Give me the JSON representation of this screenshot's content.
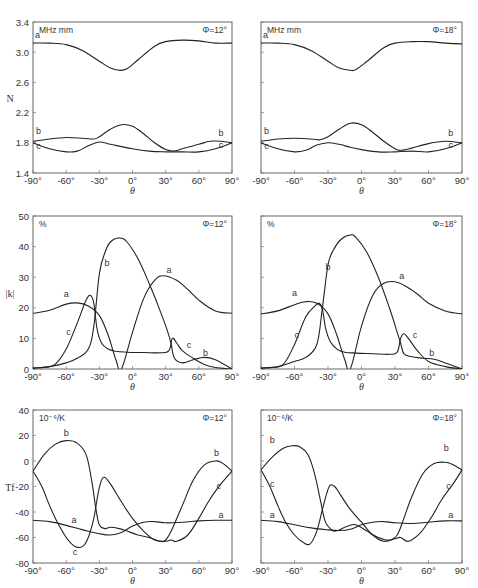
{
  "figure": {
    "x_axis": {
      "label": "θ",
      "ticks": [
        -90,
        -60,
        -30,
        0,
        30,
        60,
        90
      ],
      "tick_labels": [
        "-90°",
        "-60°",
        "-30°",
        "0°",
        "30°",
        "60°",
        "90°"
      ]
    }
  },
  "chart_data": [
    {
      "type": "line",
      "panel": "top-left",
      "title": "Φ=12°",
      "unit_label": "MHz  mm",
      "xlabel": "θ",
      "ylabel": "N",
      "xlim": [
        -90,
        90
      ],
      "ylim": [
        1.4,
        3.4
      ],
      "yticks": [
        1.4,
        1.8,
        2.2,
        2.6,
        3.0,
        3.4
      ],
      "ytick_labels": [
        "1.4",
        "1.8",
        "2.2",
        "2.6",
        "3.0",
        "3.4"
      ],
      "show_yticklabels": true,
      "grid": false,
      "series": [
        {
          "name": "a",
          "x": [
            -90,
            -75,
            -60,
            -45,
            -30,
            -20,
            -12,
            -5,
            5,
            20,
            30,
            45,
            60,
            75,
            90
          ],
          "y": [
            3.12,
            3.12,
            3.1,
            3.02,
            2.88,
            2.79,
            2.76,
            2.78,
            2.9,
            3.08,
            3.14,
            3.16,
            3.15,
            3.12,
            3.12
          ]
        },
        {
          "name": "b",
          "x": [
            -90,
            -75,
            -60,
            -45,
            -35,
            -30,
            -20,
            -10,
            0,
            10,
            20,
            30,
            37,
            45,
            60,
            70,
            80,
            90
          ],
          "y": [
            1.82,
            1.85,
            1.87,
            1.86,
            1.85,
            1.88,
            1.98,
            2.04,
            2.02,
            1.92,
            1.8,
            1.71,
            1.69,
            1.72,
            1.78,
            1.82,
            1.82,
            1.8
          ]
        },
        {
          "name": "c",
          "x": [
            -90,
            -75,
            -60,
            -50,
            -40,
            -30,
            -20,
            -10,
            0,
            15,
            30,
            45,
            60,
            75,
            90
          ],
          "y": [
            1.8,
            1.72,
            1.68,
            1.69,
            1.76,
            1.81,
            1.78,
            1.75,
            1.72,
            1.69,
            1.68,
            1.68,
            1.68,
            1.72,
            1.8
          ]
        }
      ]
    },
    {
      "type": "line",
      "panel": "top-right",
      "title": "Φ=18°",
      "unit_label": "MHz  mm",
      "xlabel": "θ",
      "ylabel": "",
      "xlim": [
        -90,
        90
      ],
      "ylim": [
        1.4,
        3.4
      ],
      "yticks": [
        1.4,
        1.8,
        2.2,
        2.6,
        3.0,
        3.4
      ],
      "show_yticklabels": false,
      "grid": false,
      "series": [
        {
          "name": "a",
          "x": [
            -90,
            -75,
            -60,
            -45,
            -30,
            -20,
            -10,
            -5,
            5,
            20,
            30,
            45,
            60,
            75,
            90
          ],
          "y": [
            3.12,
            3.12,
            3.1,
            3.02,
            2.88,
            2.79,
            2.76,
            2.77,
            2.88,
            3.06,
            3.12,
            3.14,
            3.14,
            3.12,
            3.11
          ]
        },
        {
          "name": "b",
          "x": [
            -90,
            -75,
            -60,
            -45,
            -37,
            -30,
            -20,
            -10,
            0,
            10,
            20,
            30,
            35,
            45,
            60,
            75,
            90
          ],
          "y": [
            1.82,
            1.85,
            1.86,
            1.85,
            1.84,
            1.88,
            1.98,
            2.06,
            2.04,
            1.94,
            1.82,
            1.72,
            1.7,
            1.73,
            1.79,
            1.82,
            1.8
          ]
        },
        {
          "name": "c",
          "x": [
            -90,
            -75,
            -60,
            -50,
            -40,
            -30,
            -20,
            -10,
            0,
            15,
            30,
            45,
            60,
            75,
            90
          ],
          "y": [
            1.8,
            1.72,
            1.68,
            1.7,
            1.77,
            1.8,
            1.78,
            1.74,
            1.71,
            1.68,
            1.68,
            1.69,
            1.68,
            1.72,
            1.8
          ]
        }
      ]
    },
    {
      "type": "line",
      "panel": "middle-left",
      "title": "Φ=12°",
      "unit_label": "%",
      "xlabel": "θ",
      "ylabel": "|k|",
      "xlim": [
        -90,
        90
      ],
      "ylim": [
        0,
        50
      ],
      "yticks": [
        0,
        10,
        20,
        30,
        40,
        50
      ],
      "ytick_labels": [
        "0",
        "10",
        "20",
        "30",
        "40",
        "50"
      ],
      "show_yticklabels": true,
      "grid": false,
      "series": [
        {
          "name": "a",
          "x": [
            -90,
            -75,
            -60,
            -50,
            -40,
            -30,
            -22,
            -15,
            -10,
            0,
            10,
            20,
            28,
            40,
            50,
            60,
            75,
            90
          ],
          "y": [
            18.2,
            19.2,
            21.2,
            21.6,
            20.6,
            17.5,
            11.0,
            3.0,
            0,
            12.0,
            23.0,
            29.0,
            30.5,
            29.0,
            26.0,
            22.5,
            19.0,
            18.2
          ]
        },
        {
          "name": "b",
          "x": [
            -90,
            -75,
            -60,
            -50,
            -40,
            -35,
            -30,
            -25,
            -20,
            -12,
            -5,
            5,
            15,
            25,
            32,
            35,
            38,
            45,
            55,
            65,
            75,
            90
          ],
          "y": [
            0.3,
            0.8,
            2.0,
            3.5,
            6.5,
            14.0,
            31.0,
            38.0,
            41.5,
            42.8,
            41.5,
            36.0,
            28.0,
            19.0,
            12.0,
            8.0,
            3.5,
            2.0,
            3.0,
            3.8,
            3.0,
            0
          ]
        },
        {
          "name": "c",
          "x": [
            -90,
            -80,
            -70,
            -60,
            -50,
            -42,
            -38,
            -35,
            -32,
            -28,
            -22,
            -15,
            -5,
            10,
            25,
            33,
            36,
            40,
            45,
            55,
            65,
            75,
            90
          ],
          "y": [
            0.3,
            0.5,
            1.5,
            6.5,
            15.0,
            22.5,
            24.0,
            21.5,
            13.0,
            8.5,
            6.5,
            5.8,
            5.5,
            5.4,
            5.3,
            6.0,
            10.0,
            8.5,
            6.0,
            3.5,
            1.5,
            0.5,
            0
          ]
        }
      ]
    },
    {
      "type": "line",
      "panel": "middle-right",
      "title": "Φ=18°",
      "unit_label": "%",
      "xlabel": "θ",
      "ylabel": "",
      "xlim": [
        -90,
        90
      ],
      "ylim": [
        0,
        50
      ],
      "yticks": [
        0,
        10,
        20,
        30,
        40,
        50
      ],
      "show_yticklabels": false,
      "grid": false,
      "series": [
        {
          "name": "a",
          "x": [
            -90,
            -75,
            -60,
            -50,
            -40,
            -30,
            -22,
            -15,
            -10,
            0,
            10,
            20,
            30,
            40,
            50,
            60,
            75,
            90
          ],
          "y": [
            18.0,
            19.0,
            21.0,
            22.0,
            21.5,
            18.0,
            11.0,
            3.0,
            0,
            14.0,
            24.0,
            28.0,
            28.5,
            27.0,
            24.5,
            21.5,
            19.0,
            18.0
          ]
        },
        {
          "name": "b",
          "x": [
            -90,
            -75,
            -60,
            -50,
            -40,
            -35,
            -30,
            -25,
            -18,
            -10,
            -5,
            5,
            15,
            25,
            32,
            35,
            38,
            45,
            55,
            65,
            75,
            90
          ],
          "y": [
            0.3,
            0.8,
            2.5,
            3.8,
            8.0,
            20.0,
            34.0,
            39.0,
            42.5,
            43.8,
            43.0,
            38.0,
            30.0,
            20.0,
            12.0,
            8.5,
            5.0,
            4.0,
            3.5,
            3.2,
            2.0,
            0
          ]
        },
        {
          "name": "c",
          "x": [
            -90,
            -80,
            -70,
            -60,
            -50,
            -42,
            -38,
            -35,
            -32,
            -28,
            -22,
            -15,
            -5,
            10,
            25,
            32,
            35,
            38,
            42,
            50,
            60,
            75,
            90
          ],
          "y": [
            0.3,
            0.5,
            1.5,
            8.0,
            17.0,
            20.5,
            21.5,
            19.5,
            13.0,
            9.0,
            6.5,
            5.5,
            5.2,
            5.0,
            4.8,
            5.5,
            10.0,
            11.5,
            10.0,
            6.0,
            2.5,
            0.8,
            0
          ]
        }
      ]
    },
    {
      "type": "line",
      "panel": "bottom-left",
      "title": "Φ=12°",
      "unit_label": "10⁻⁶/K",
      "xlabel": "θ",
      "ylabel": "Tf",
      "xlim": [
        -90,
        90
      ],
      "ylim": [
        -80,
        40
      ],
      "yticks": [
        -80,
        -60,
        -40,
        -20,
        0,
        20,
        40
      ],
      "ytick_labels": [
        "-80",
        "-60",
        "-40",
        "-20",
        "0",
        "20",
        "40"
      ],
      "show_yticklabels": true,
      "grid": false,
      "series": [
        {
          "name": "a",
          "x": [
            -90,
            -75,
            -60,
            -45,
            -30,
            -20,
            -10,
            0,
            10,
            20,
            30,
            45,
            60,
            75,
            90
          ],
          "y": [
            -46.5,
            -47.5,
            -50.5,
            -54.0,
            -57.0,
            -58.0,
            -56.0,
            -51.0,
            -48.0,
            -47.5,
            -48.5,
            -48.0,
            -47.0,
            -46.5,
            -46.5
          ]
        },
        {
          "name": "b",
          "x": [
            -90,
            -80,
            -70,
            -60,
            -50,
            -42,
            -37,
            -33,
            -30,
            -25,
            -20,
            -12,
            -5,
            5,
            15,
            25,
            30,
            35,
            45,
            55,
            65,
            75,
            80,
            85,
            90
          ],
          "y": [
            -8,
            5,
            13,
            16,
            14,
            5,
            -15,
            -38,
            -50,
            -53,
            -52,
            -53,
            -55,
            -58,
            -60,
            -63,
            -62,
            -55,
            -35,
            -15,
            -3,
            0,
            -1,
            -4,
            -8
          ]
        },
        {
          "name": "c",
          "x": [
            -90,
            -82,
            -75,
            -68,
            -60,
            -52,
            -45,
            -40,
            -35,
            -31,
            -28,
            -25,
            -20,
            -10,
            0,
            10,
            20,
            30,
            35,
            40,
            50,
            60,
            70,
            80,
            90
          ],
          "y": [
            -8,
            -20,
            -35,
            -48,
            -60,
            -67,
            -67,
            -60,
            -45,
            -25,
            -15,
            -13,
            -18,
            -32,
            -45,
            -55,
            -62,
            -63,
            -62,
            -63,
            -58,
            -45,
            -30,
            -18,
            -8
          ]
        }
      ]
    },
    {
      "type": "line",
      "panel": "bottom-right",
      "title": "Φ=18°",
      "unit_label": "10⁻⁶/K",
      "xlabel": "θ",
      "ylabel": "",
      "xlim": [
        -90,
        90
      ],
      "ylim": [
        -80,
        40
      ],
      "yticks": [
        -80,
        -60,
        -40,
        -20,
        0,
        20,
        40
      ],
      "show_yticklabels": false,
      "grid": false,
      "series": [
        {
          "name": "a",
          "x": [
            -90,
            -75,
            -60,
            -45,
            -30,
            -20,
            -10,
            0,
            10,
            20,
            30,
            45,
            60,
            75,
            90
          ],
          "y": [
            -46.5,
            -47.5,
            -50.0,
            -52.5,
            -54.0,
            -54.5,
            -53.5,
            -50.0,
            -48.0,
            -47.5,
            -48.5,
            -49.0,
            -48.0,
            -47.0,
            -47.0
          ]
        },
        {
          "name": "b",
          "x": [
            -90,
            -80,
            -70,
            -62,
            -55,
            -48,
            -42,
            -37,
            -33,
            -30,
            -25,
            -20,
            -12,
            -5,
            5,
            15,
            25,
            32,
            38,
            45,
            55,
            65,
            75,
            82,
            90
          ],
          "y": [
            -7,
            3,
            10,
            12,
            11,
            5,
            -10,
            -30,
            -46,
            -51,
            -55,
            -54,
            -51,
            -50,
            -55,
            -60,
            -62,
            -58,
            -45,
            -28,
            -10,
            -2,
            -1,
            -3,
            -7
          ]
        },
        {
          "name": "c",
          "x": [
            -90,
            -82,
            -75,
            -68,
            -60,
            -52,
            -46,
            -40,
            -35,
            -31,
            -28,
            -24,
            -20,
            -10,
            0,
            10,
            20,
            30,
            35,
            42,
            52,
            62,
            72,
            82,
            90
          ],
          "y": [
            -7,
            -20,
            -35,
            -48,
            -58,
            -64,
            -65,
            -55,
            -38,
            -25,
            -19,
            -20,
            -25,
            -38,
            -48,
            -58,
            -63,
            -61,
            -60,
            -63,
            -57,
            -45,
            -30,
            -18,
            -7
          ]
        }
      ]
    }
  ]
}
